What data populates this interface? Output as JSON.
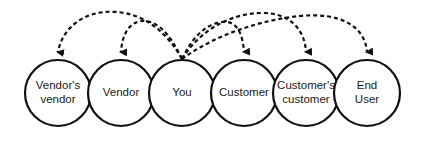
{
  "diagram": {
    "type": "value-chain",
    "colors": {
      "stroke": "#111111",
      "fill": "#ffffff",
      "text": "#1a1a1a"
    },
    "nodes": [
      {
        "id": "vendors-vendor",
        "lines": [
          "Vendor's",
          "vendor"
        ],
        "cx": 58
      },
      {
        "id": "vendor",
        "lines": [
          "Vendor"
        ],
        "cx": 121
      },
      {
        "id": "you",
        "lines": [
          "You"
        ],
        "cx": 182
      },
      {
        "id": "customer",
        "lines": [
          "Customer"
        ],
        "cx": 244
      },
      {
        "id": "customers-customer",
        "lines": [
          "Customer's",
          "customer"
        ],
        "cx": 306
      },
      {
        "id": "end-user",
        "lines": [
          "End",
          "User"
        ],
        "cx": 367
      }
    ],
    "edges": [
      {
        "from": "you",
        "to": "vendors-vendor",
        "style": "dashed",
        "arrow": "end"
      },
      {
        "from": "you",
        "to": "vendor",
        "style": "dashed",
        "arrow": "end"
      },
      {
        "from": "you",
        "to": "customer",
        "style": "dashed",
        "arrow": "end"
      },
      {
        "from": "you",
        "to": "customers-customer",
        "style": "dashed",
        "arrow": "end"
      },
      {
        "from": "you",
        "to": "end-user",
        "style": "dashed",
        "arrow": "end"
      }
    ]
  }
}
